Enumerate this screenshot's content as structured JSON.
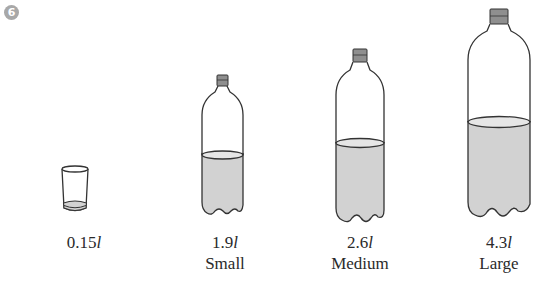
{
  "exercise": {
    "number": "6",
    "badge_color": "#a8a8a8"
  },
  "containers": [
    {
      "type": "glass",
      "volume_value": "0.15",
      "unit": "l",
      "size_name": ""
    },
    {
      "type": "bottle",
      "volume_value": "1.9",
      "unit": "l",
      "size_name": "Small"
    },
    {
      "type": "bottle",
      "volume_value": "2.6",
      "unit": "l",
      "size_name": "Medium"
    },
    {
      "type": "bottle",
      "volume_value": "4.3",
      "unit": "l",
      "size_name": "Large"
    }
  ],
  "colors": {
    "outline": "#333333",
    "liquid": "#d2d2d2",
    "cap": "#8f8f8f"
  }
}
